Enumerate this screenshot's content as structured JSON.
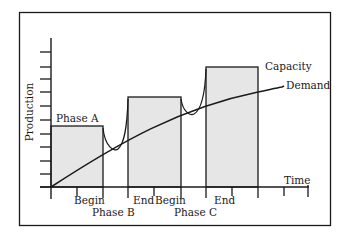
{
  "diagram": {
    "y_axis_label": "Production",
    "x_axis_label": "Time",
    "curves": {
      "capacity_label": "Capacity",
      "demand_label": "Demand"
    },
    "phases": [
      {
        "name": "Phase A",
        "label": "Phase A"
      },
      {
        "name": "Phase B",
        "label": "Phase B",
        "begin_label": "Begin",
        "end_label": "End"
      },
      {
        "name": "Phase C",
        "label": "Phase C",
        "begin_label": "Begin",
        "end_label": "End"
      }
    ],
    "colors": {
      "fill": "#e6e6e6",
      "stroke": "#1a1a1a",
      "background": "#ffffff"
    }
  }
}
